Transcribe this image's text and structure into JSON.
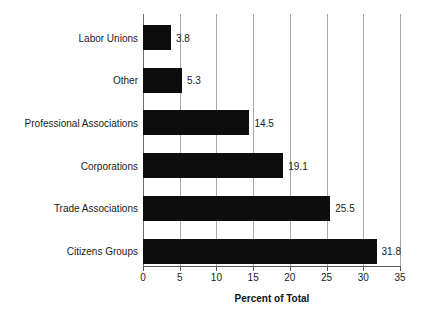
{
  "chart_data": {
    "type": "bar",
    "orientation": "horizontal",
    "title": "",
    "xlabel": "Percent of Total",
    "ylabel": "",
    "xlim": [
      0,
      35
    ],
    "xticks": [
      0,
      5,
      10,
      15,
      20,
      25,
      30,
      35
    ],
    "xtick_labels": [
      "0",
      "5",
      "10",
      "15",
      "20",
      "25",
      "30",
      "35"
    ],
    "grid": true,
    "legend": null,
    "bar_color": "#0d0d0d",
    "grid_color": "#a8a8a8",
    "axis_color": "#555555",
    "categories": [
      "Labor Unions",
      "Other",
      "Professional Associations",
      "Corporations",
      "Trade Associations",
      "Citizens Groups"
    ],
    "values": [
      3.8,
      5.3,
      14.5,
      19.1,
      25.5,
      31.8
    ],
    "value_labels": [
      "3.8",
      "5.3",
      "14.5",
      "19.1",
      "25.5",
      "31.8"
    ]
  }
}
